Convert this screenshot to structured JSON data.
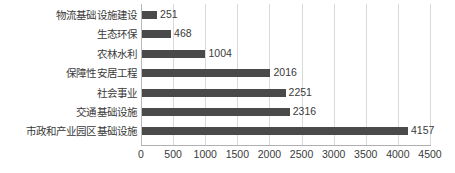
{
  "chart_data": {
    "type": "bar",
    "orientation": "horizontal",
    "title": "",
    "subtitle": "",
    "xlabel": "",
    "ylabel": "",
    "categories": [
      "物流基础设施建设",
      "生态环保",
      "农林水利",
      "保障性安居工程",
      "社会事业",
      "交通基础设施",
      "市政和产业园区基础设施"
    ],
    "values": [
      251,
      468,
      1004,
      2016,
      2251,
      2316,
      4157
    ],
    "value_labels": [
      "251",
      "468",
      "1004",
      "2016",
      "2251",
      "2316",
      "4157"
    ],
    "xlim": [
      0,
      4500
    ],
    "xticks": [
      0,
      500,
      1000,
      1500,
      2000,
      2500,
      3000,
      3500,
      4000,
      4500
    ],
    "xtick_labels": [
      "0",
      "500",
      "1000",
      "1500",
      "2000",
      "2500",
      "3000",
      "3500",
      "4000",
      "4500"
    ],
    "grid": true,
    "grid_axis": "x",
    "legend": false,
    "legend_position": "none",
    "bar_color": "#4a4a4a",
    "grid_color": "#d9d9d9",
    "axis_color": "#b0b0b0",
    "text_color": "#3a3a3a",
    "background_color": "#ffffff"
  }
}
